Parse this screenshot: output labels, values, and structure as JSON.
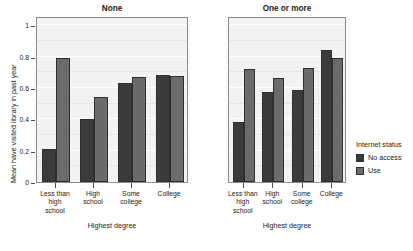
{
  "chart_data": {
    "type": "bar",
    "title": "",
    "xlabel": "Highest degree",
    "ylabel": "Mean have visited library in past year",
    "ylim": [
      0,
      1.06
    ],
    "yticks": [
      0,
      0.2,
      0.4,
      0.6,
      0.8,
      1
    ],
    "ytick_labels": [
      "0",
      "0.2",
      "0.4",
      "0.6",
      "0.8",
      "1"
    ],
    "grid": true,
    "legend": {
      "title": "Internet status",
      "position": "right",
      "entries": [
        {
          "name": "No access",
          "color": "#3b3b3b"
        },
        {
          "name": "Use",
          "color": "#6b6b6b"
        }
      ]
    },
    "categories": [
      "Less than\nhigh\nschool",
      "High\nschool",
      "Some\ncollege",
      "College"
    ],
    "facets": [
      {
        "label": "None",
        "xlabel": "Highest degree",
        "series": [
          {
            "name": "No access",
            "color": "#3b3b3b",
            "values": [
              0.21,
              0.4,
              0.63,
              0.685
            ]
          },
          {
            "name": "Use",
            "color": "#6b6b6b",
            "values": [
              0.79,
              0.54,
              0.67,
              0.68
            ]
          }
        ]
      },
      {
        "label": "One or more",
        "xlabel": "Highest degree",
        "series": [
          {
            "name": "No access",
            "color": "#3b3b3b",
            "values": [
              0.385,
              0.575,
              0.59,
              0.84
            ]
          },
          {
            "name": "Use",
            "color": "#6b6b6b",
            "values": [
              0.72,
              0.665,
              0.725,
              0.79
            ]
          }
        ]
      }
    ]
  },
  "axis": {
    "ylabel": "Mean have visited library in past year",
    "xlabel_left": "Highest degree",
    "xlabel_right": "Highest degree"
  },
  "panels": {
    "left_title": "None",
    "right_title": "One or more"
  },
  "ytick_labels": {
    "t0": "0",
    "t1": "0.2",
    "t2": "0.4",
    "t3": "0.6",
    "t4": "0.8",
    "t5": "1"
  },
  "xtick_labels": {
    "c0": "Less than\nhigh\nschool",
    "c1": "High\nschool",
    "c2": "Some\ncollege",
    "c3": "College"
  },
  "legend": {
    "title": "Internet status",
    "item0": "No access",
    "item1": "Use"
  },
  "colors": {
    "no_access": "#3b3b3b",
    "use": "#6b6b6b",
    "panel_bg": "#f2f2f2",
    "panel_border": "#8a8a8a",
    "grid": "#ffffff"
  }
}
